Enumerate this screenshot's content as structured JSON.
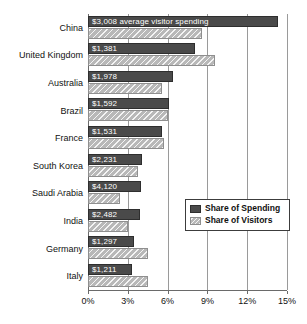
{
  "chart_data": {
    "type": "bar",
    "orientation": "horizontal",
    "title": "",
    "xlabel": "",
    "ylabel": "",
    "xlim": [
      0,
      15
    ],
    "x_unit": "%",
    "grid": true,
    "legend_position": "middle-right",
    "xticks": [
      "0%",
      "3%",
      "6%",
      "9%",
      "12%",
      "15%"
    ],
    "xtick_values": [
      0,
      3,
      6,
      9,
      12,
      15
    ],
    "categories": [
      "China",
      "United Kingdom",
      "Australia",
      "Brazil",
      "France",
      "South Korea",
      "Saudi Arabia",
      "India",
      "Germany",
      "Italy"
    ],
    "series": [
      {
        "name": "Share of Spending",
        "color": "#4a4a4a",
        "values": [
          14.3,
          8.1,
          6.4,
          6.1,
          5.6,
          4.1,
          4.0,
          3.9,
          3.5,
          3.3
        ]
      },
      {
        "name": "Share of Visitors",
        "color": "#b8b8b8",
        "values": [
          8.6,
          9.6,
          5.6,
          6.0,
          5.7,
          3.8,
          2.4,
          3.0,
          4.5,
          4.5
        ]
      }
    ],
    "bar_labels": [
      "$3,008 average visitor spending",
      "$1,381",
      "$1,978",
      "$1,592",
      "$1,531",
      "$2,231",
      "$4,120",
      "$2,482",
      "$1,297",
      "$1,211"
    ],
    "annotations": [
      {
        "text": "$3,008 average visitor spending",
        "attached_to": "China",
        "series": "Share of Spending"
      }
    ]
  },
  "legend": {
    "items": [
      {
        "label": "Share of Spending",
        "swatch": "dark-solid-swatch"
      },
      {
        "label": "Share of Visitors",
        "swatch": "light-hatched-swatch"
      }
    ]
  }
}
